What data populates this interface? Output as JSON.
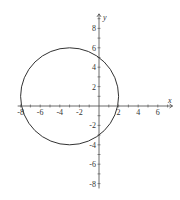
{
  "chart_data": {
    "type": "line",
    "title": "",
    "xlabel": "x",
    "ylabel": "y",
    "xlim": [
      -8.3,
      7.5
    ],
    "ylim": [
      -8.5,
      9.5
    ],
    "grid": false,
    "x_ticks": [
      -8,
      -6,
      -4,
      -2,
      2,
      4,
      6
    ],
    "x_tick_labels": [
      "-8",
      "-6",
      "-4",
      "-2",
      "2",
      "4",
      "6"
    ],
    "y_ticks": [
      8,
      6,
      4,
      2,
      -2,
      -4,
      -6,
      -8
    ],
    "y_tick_labels": [
      "8",
      "6",
      "4",
      "2",
      "-2",
      "-4",
      "-6",
      "-8"
    ],
    "series": [
      {
        "name": "circle",
        "shape": "circle",
        "center": [
          -3,
          1
        ],
        "radius": 5,
        "equation": "(x+3)^2 + (y-1)^2 = 25",
        "color": "#333333"
      }
    ],
    "key_points": {
      "x_intercepts": [
        -8,
        2
      ],
      "top": [
        -3,
        6
      ],
      "bottom": [
        -3,
        -4
      ]
    }
  },
  "axes": {
    "x_label": "x",
    "y_label": "y"
  }
}
